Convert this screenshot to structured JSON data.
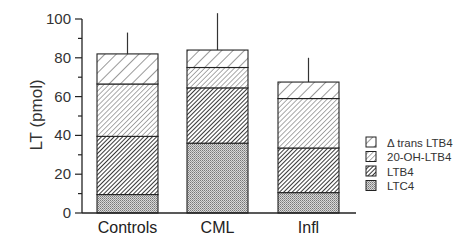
{
  "chart_data": {
    "type": "bar",
    "stacked": true,
    "title": "",
    "xlabel": "",
    "ylabel": "LT  (pmol)",
    "ylim": [
      0,
      100
    ],
    "yticks": [
      0,
      20,
      40,
      60,
      80,
      100
    ],
    "categories": [
      "Controls",
      "CML",
      "Infl"
    ],
    "series": [
      {
        "name": "LTC4",
        "values": [
          9.5,
          36,
          10.5
        ],
        "pattern": "dots-dense"
      },
      {
        "name": "LTB4",
        "values": [
          30,
          28.5,
          23
        ],
        "pattern": "hatch-dark"
      },
      {
        "name": "20-OH-LTB4",
        "values": [
          27,
          10.5,
          25.5
        ],
        "pattern": "hatch-fine"
      },
      {
        "name": "Δ trans LTB4",
        "values": [
          15.5,
          9,
          8.5
        ],
        "pattern": "hatch-wide"
      }
    ],
    "totals": [
      82,
      84,
      67.5
    ],
    "error_bar_tops": [
      93,
      103,
      80
    ],
    "legend": {
      "position": "right",
      "items": [
        "Δ  trans LTB4",
        "20-OH-LTB4",
        "LTB4",
        "LTC4"
      ]
    },
    "grid": false
  }
}
